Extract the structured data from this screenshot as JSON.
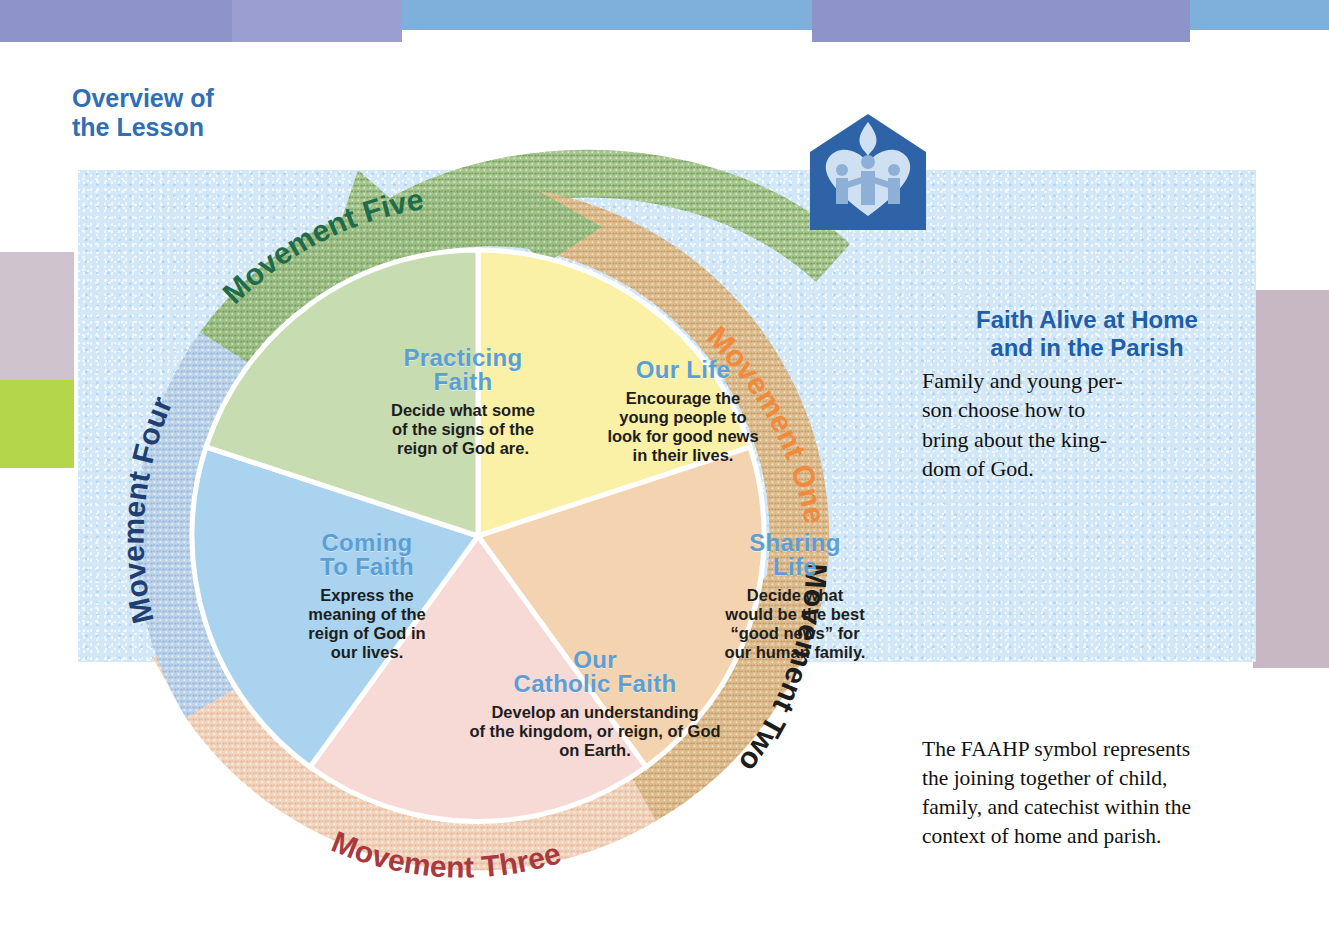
{
  "page": {
    "overview_heading_line1": "Overview of",
    "overview_heading_line2": "the Lesson"
  },
  "colors": {
    "heading_blue": "#2f6fb5",
    "wedge_title_blue": "#5b9fd4",
    "wedge_green": "#c7dcb0",
    "wedge_yellow": "#faf0a6",
    "wedge_peach": "#f3d3b0",
    "wedge_pink": "#f7d9d6",
    "wedge_blue": "#a9d3ee",
    "ring_green": "#8fb97e",
    "ring_tan": "#dbb487",
    "ring_peach": "#f0cdb4",
    "ring_blue": "#a9c4e3",
    "label_green": "#1f6b4a",
    "label_orange": "#f08a3c",
    "label_dark": "#1d1d1b",
    "label_maroon": "#a8393f",
    "label_navy": "#1f3f73",
    "logo_blue": "#2e63a8",
    "panel_blue": "#d2e8f8"
  },
  "wheel": {
    "center_label": "Lesson Movement Wheel",
    "ring_labels": [
      {
        "name": "movement-one",
        "text": "Movement One",
        "color": "#f08a3c"
      },
      {
        "name": "movement-two",
        "text": "Movement Two",
        "color": "#1d1d1b"
      },
      {
        "name": "movement-three",
        "text": "Movement Three",
        "color": "#a8393f"
      },
      {
        "name": "movement-four",
        "text": "Movement Four",
        "color": "#1f3f73"
      },
      {
        "name": "movement-five",
        "text": "Movement Five",
        "color": "#1f6b4a"
      }
    ],
    "wedges": [
      {
        "id": "our-life",
        "title": "Our Life",
        "body": "Encourage the young people to look for good news in their lives.",
        "body_lines": [
          "Encourage the",
          "young people to",
          "look for good news",
          "in their lives."
        ],
        "fill": "#faf0a6"
      },
      {
        "id": "sharing-life",
        "title_line1": "Sharing",
        "title_line2": "Life",
        "title": "Sharing Life",
        "body": "Decide what would be the best “good news” for our human family.",
        "body_lines": [
          "Decide what",
          "would be the best",
          "“good news” for",
          "our human family."
        ],
        "fill": "#f3d3b0"
      },
      {
        "id": "our-catholic-faith",
        "title_line1": "Our",
        "title_line2": "Catholic Faith",
        "title": "Our Catholic Faith",
        "body": "Develop an understanding of the kingdom, or reign, of God on Earth.",
        "body_lines": [
          "Develop an understanding",
          "of the kingdom, or reign, of  God",
          "on Earth."
        ],
        "fill": "#f7d9d6"
      },
      {
        "id": "coming-to-faith",
        "title_line1": "Coming",
        "title_line2": "To Faith",
        "title": "Coming To Faith",
        "body": "Express the meaning of the reign of God in our lives.",
        "body_lines": [
          "Express the",
          "meaning of the",
          "reign of God in",
          "our lives."
        ],
        "fill": "#a9d3ee"
      },
      {
        "id": "practicing-faith",
        "title_line1": "Practicing",
        "title_line2": "Faith",
        "title": "Practicing Faith",
        "body": "Decide what some of the signs of the reign of God are.",
        "body_lines": [
          "Decide what some",
          "of the signs of the",
          "reign of God are."
        ],
        "fill": "#c7dcb0"
      }
    ]
  },
  "faith_alive": {
    "title_line1": "Faith Alive at Home",
    "title_line2": "and in the Parish",
    "body_lines": [
      "Family and young per-",
      "son choose how to",
      "bring about the king-",
      "dom of God."
    ]
  },
  "faahp_caption": {
    "lines": [
      "The FAAHP symbol represents",
      "the joining together of child,",
      "family, and catechist within the",
      "context of home and parish."
    ]
  },
  "logo": {
    "name": "faahp-symbol",
    "description": "blue house pentagon with heart, three figures and dove flame"
  }
}
